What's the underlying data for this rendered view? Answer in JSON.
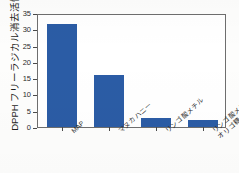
{
  "chart_data": {
    "type": "bar",
    "title": "",
    "subtitle": "",
    "xlabel": "",
    "ylabel": "DPPH フリーラジカル消去活性 (%)",
    "categories": [
      "MAP",
      "マヌカハニー",
      "リンゴ酸メチル",
      "リンゴ酸メチルと\nオリゴ糖"
    ],
    "category_lines": [
      [
        "MAP"
      ],
      [
        "マヌカハニー"
      ],
      [
        "リンゴ酸メチル"
      ],
      [
        "リンゴ酸メチルと",
        "オリゴ糖"
      ]
    ],
    "values": [
      31.7,
      16.0,
      2.7,
      2.2
    ],
    "ylim": [
      0,
      35
    ],
    "yticks": [
      0,
      5,
      10,
      15,
      20,
      25,
      30,
      35
    ],
    "ytick_labels": [
      "0",
      "5",
      "10",
      "15",
      "20",
      "25",
      "30",
      "35"
    ],
    "grid": false,
    "legend": null,
    "legend_position": "none",
    "bar_color": "#2b5ca5",
    "axis_color": "#6e6e6e",
    "background_color": "#ffffff",
    "page_background": "#fdfdfc"
  }
}
